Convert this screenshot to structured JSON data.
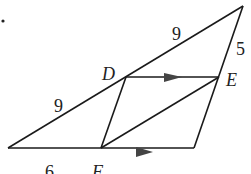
{
  "diagram": {
    "bullet": "•",
    "points": {
      "D": "D",
      "E": "E",
      "F": "F"
    },
    "lengths": {
      "top_segment": "9",
      "left_segment": "9",
      "right_segment": "5",
      "bottom_segment": "6"
    },
    "colors": {
      "line": "#1a1a1a",
      "arrow": "#444444"
    }
  }
}
